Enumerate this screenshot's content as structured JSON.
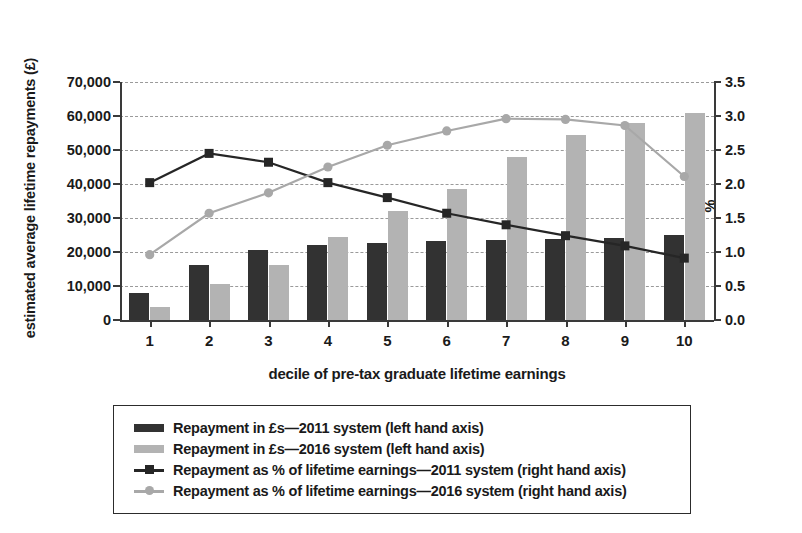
{
  "chart_data": {
    "type": "bar",
    "title": "",
    "subtitle": "",
    "xlabel": "decile of pre-tax graduate lifetime earnings",
    "ylabel": "estimated average lifetime repayments (£)",
    "ylabel_right": "%",
    "categories": [
      "1",
      "2",
      "3",
      "4",
      "5",
      "6",
      "7",
      "8",
      "9",
      "10"
    ],
    "ylim": [
      0,
      70000
    ],
    "ylim_right": [
      0,
      3.5
    ],
    "yticks": [
      "0",
      "10,000",
      "20,000",
      "30,000",
      "40,000",
      "50,000",
      "60,000",
      "70,000"
    ],
    "ytick_values": [
      0,
      10000,
      20000,
      30000,
      40000,
      50000,
      60000,
      70000
    ],
    "yticks_right": [
      "0.0",
      "0.5",
      "1.0",
      "1.5",
      "2.0",
      "2.5",
      "3.0",
      "3.5"
    ],
    "ytick_values_right": [
      0,
      0.5,
      1.0,
      1.5,
      2.0,
      2.5,
      3.0,
      3.5
    ],
    "grid": true,
    "legend_position": "below",
    "series": [
      {
        "name": "Repayment in £s—2011 system (left hand axis)",
        "kind": "bar",
        "axis": "left",
        "color": "#323232",
        "values": [
          7800,
          16200,
          20500,
          22000,
          22700,
          23200,
          23600,
          23900,
          24100,
          25000
        ]
      },
      {
        "name": "Repayment in £s—2016 system (left hand axis)",
        "kind": "bar",
        "axis": "left",
        "color": "#b3b3b3",
        "values": [
          3700,
          10500,
          16200,
          24500,
          32200,
          38500,
          47800,
          54400,
          57800,
          60800
        ]
      },
      {
        "name": "Repayment as % of lifetime earnings—2011 system (right hand axis)",
        "kind": "line",
        "axis": "right",
        "marker": "square",
        "color": "#262626",
        "values": [
          2.02,
          2.45,
          2.32,
          2.02,
          1.8,
          1.57,
          1.4,
          1.24,
          1.09,
          0.91
        ]
      },
      {
        "name": "Repayment as % of lifetime earnings—2016 system (right hand axis)",
        "kind": "line",
        "axis": "right",
        "marker": "circle",
        "color": "#a8a8a8",
        "values": [
          0.96,
          1.57,
          1.87,
          2.25,
          2.57,
          2.78,
          2.96,
          2.95,
          2.86,
          2.11
        ]
      }
    ]
  },
  "legend": {
    "items": [
      {
        "label": "Repayment in £s—2011 system (left hand axis)",
        "glyph": "bar-swatch-dark"
      },
      {
        "label": "Repayment in £s—2016 system (left hand axis)",
        "glyph": "bar-swatch-grey"
      },
      {
        "label": "Repayment as % of lifetime earnings—2011 system (right hand axis)",
        "glyph": "line-marker-square-dark"
      },
      {
        "label": "Repayment as % of lifetime earnings—2016 system (right hand axis)",
        "glyph": "line-marker-circle-grey"
      }
    ]
  },
  "colors": {
    "bar_2011": "#323232",
    "bar_2016": "#b3b3b3",
    "line_2011": "#262626",
    "line_2016": "#a8a8a8",
    "axis": "#3a3a3a",
    "grid": "#9a9a9a",
    "background": "#ffffff"
  }
}
